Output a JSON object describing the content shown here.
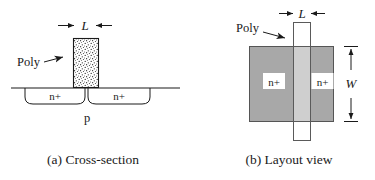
{
  "figure": {
    "title_hidden": "",
    "panels": [
      {
        "id": "cross-section",
        "caption": "(a) Cross-section",
        "dimension_label": "L",
        "poly_label": "Poly",
        "substrate_label": "p",
        "diffusion_labels": [
          "n+",
          "n+"
        ],
        "poly_fill": "stipple"
      },
      {
        "id": "layout-view",
        "caption": "(b) Layout view",
        "dimension_label_horizontal": "L",
        "dimension_label_vertical": "W",
        "poly_label": "Poly",
        "diffusion_labels": [
          "n+",
          "n+"
        ],
        "active_fill": "#a8a8a8",
        "poly_fill": "#ffffff"
      }
    ]
  },
  "colors": {
    "ink": "#1a1a1a",
    "active_gray": "#a8a8a8",
    "poly_overlay": "#c4c4c4",
    "paper": "#ffffff"
  }
}
